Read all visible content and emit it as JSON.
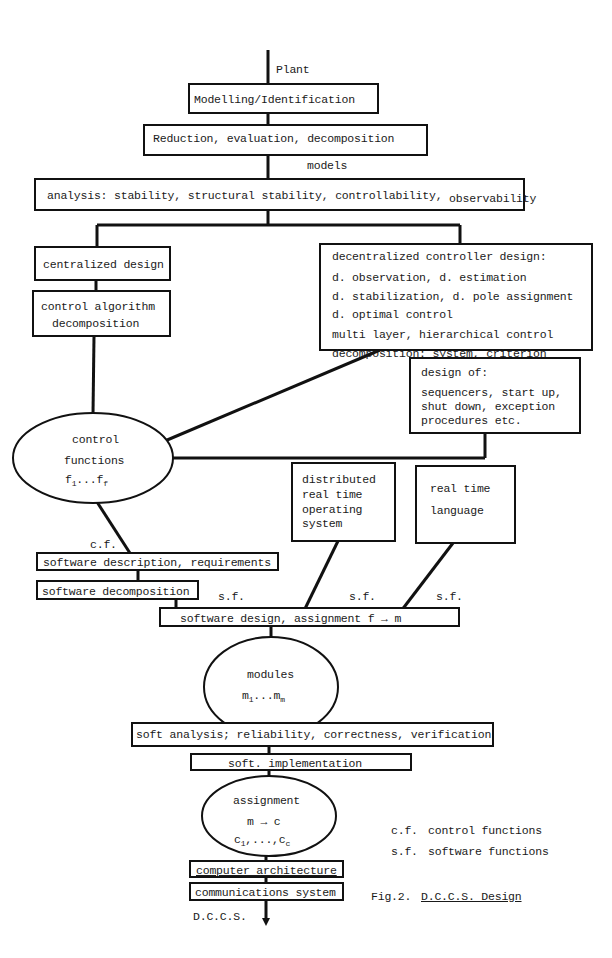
{
  "diagram": {
    "input_label": "Plant",
    "modelling_box": "Modelling/Identification",
    "edge_models_1": "models",
    "reduction_box": "Reduction, evaluation, decomposition",
    "edge_models_2": "models",
    "analysis_box": "analysis: stability, structural stability, controllability,",
    "analysis_box_tail": "observability",
    "centralized_box": "centralized design",
    "control_algorithm_box": {
      "line1": "control algorithm",
      "line2": "decomposition"
    },
    "decentralized_box": {
      "title": "decentralized controller design:",
      "lines": [
        "d. observation, d. estimation",
        "d. stabilization, d. pole assignment",
        "d. optimal control",
        "multi layer, hierarchical control",
        "decomposition: system, criterion"
      ]
    },
    "design_of_box": {
      "title": "design of:",
      "lines": [
        "sequencers, start up,",
        "shut down, exception",
        "procedures etc."
      ]
    },
    "control_functions_node": {
      "line1": "control",
      "line2": "functions",
      "range_base_a": "f",
      "range_sub_a": "1",
      "range_dots": "...",
      "range_base_b": "f",
      "range_sub_b": "f"
    },
    "rtos_box": {
      "lines": [
        "distributed",
        "real time",
        "operating",
        "system"
      ]
    },
    "rt_language_box": {
      "line1": "real time",
      "line2": "language"
    },
    "edge_cf": "c.f.",
    "software_description_box": "software description, requirements",
    "software_decomposition_box": "software decomposition",
    "edge_sf_1": "s.f.",
    "edge_sf_2": "s.f.",
    "edge_sf_3": "s.f.",
    "software_design_box": "software design, assignment f → m",
    "modules_node": {
      "line1": "modules",
      "range_base_a": "m",
      "range_sub_a": "1",
      "range_dots": "...",
      "range_base_b": "m",
      "range_sub_b": "m"
    },
    "soft_analysis_box": "soft analysis; reliability, correctness, verification",
    "soft_implementation_box": "soft. implementation",
    "assignment_node": {
      "line1": "assignment",
      "line2": "m → c",
      "range_base_a": "c",
      "range_sub_a": "1",
      "range_dots": ",...,",
      "range_base_b": "c",
      "range_sub_b": "c"
    },
    "computer_architecture_box": "computer architecture",
    "communications_box": "communications system",
    "output_label": "D.C.C.S."
  },
  "legend": [
    {
      "abbr": "c.f.",
      "meaning": "control functions"
    },
    {
      "abbr": "s.f.",
      "meaning": "software functions"
    }
  ],
  "caption": {
    "prefix": "Fig.2.",
    "title": "D.C.C.S. Design"
  }
}
